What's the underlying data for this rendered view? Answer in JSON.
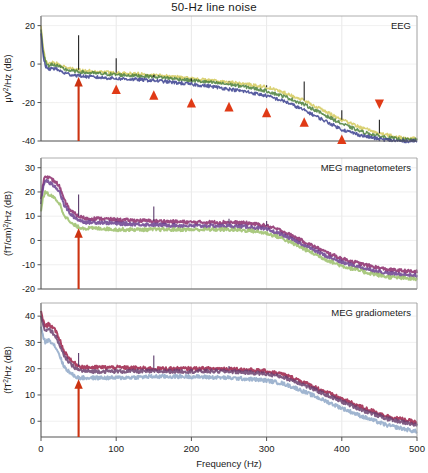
{
  "figure": {
    "title": "50-Hz line noise",
    "xlabel": "Frequency (Hz)",
    "xticks": [
      "0",
      "100",
      "200",
      "300",
      "400",
      "500"
    ],
    "arrow_color": "#cc3311",
    "marker_color": "#e03a16"
  },
  "panels": {
    "eeg": {
      "tag": "EEG",
      "ylabel_main": "/Hz (dB)",
      "ylabel_prefix": "μV",
      "ylabel_sup": "2",
      "yticks": [
        "20",
        "0",
        "-20",
        "-40"
      ]
    },
    "mag": {
      "tag": "MEG magnetometers",
      "ylabel_main": "/Hz (dB)",
      "ylabel_prefix": "(fT/cm)",
      "ylabel_sup": "2",
      "yticks": [
        "30",
        "20",
        "10",
        "0",
        "-10",
        "-20"
      ]
    },
    "grad": {
      "tag": "MEG gradiometers",
      "ylabel_main": "/Hz (dB)",
      "ylabel_prefix": "(fT",
      "ylabel_sup": "2",
      "ylabel_suffix": "",
      "yticks": [
        "40",
        "30",
        "20",
        "10",
        "0"
      ]
    }
  },
  "chart_data": {
    "type": "line",
    "title": "50-Hz line noise",
    "xlabel": "Frequency (Hz)",
    "xlim": [
      0,
      500
    ],
    "xticks": [
      0,
      100,
      200,
      300,
      400,
      500
    ],
    "grid": true,
    "legend": "none",
    "subplots": [
      {
        "name": "EEG",
        "ylabel": "μV2/Hz (dB)",
        "ylim": [
          -40,
          25
        ],
        "yticks": [
          20,
          0,
          -20,
          -40
        ],
        "annotations": [
          {
            "type": "arrow",
            "x": 50,
            "y_from": -40,
            "y_to": -8,
            "color": "#cc3311",
            "label": "50-Hz line noise"
          },
          {
            "type": "triangle-up",
            "x": 100,
            "y": -13
          },
          {
            "type": "triangle-up",
            "x": 150,
            "y": -16
          },
          {
            "type": "triangle-up",
            "x": 200,
            "y": -20
          },
          {
            "type": "triangle-up",
            "x": 250,
            "y": -22
          },
          {
            "type": "triangle-up",
            "x": 300,
            "y": -25
          },
          {
            "type": "triangle-up",
            "x": 350,
            "y": -30
          },
          {
            "type": "triangle-up",
            "x": 400,
            "y": -39
          },
          {
            "type": "triangle-down",
            "x": 450,
            "y": -21
          }
        ],
        "series": [
          {
            "name": "band-upper",
            "color": "#d4c95a",
            "x": [
              0,
              3,
              6,
              10,
              15,
              20,
              25,
              30,
              40,
              50,
              60,
              80,
              100,
              125,
              150,
              175,
              200,
              225,
              250,
              275,
              300,
              325,
              350,
              375,
              400,
              425,
              450,
              475,
              500
            ],
            "values": [
              20,
              8,
              2,
              0,
              1,
              0.5,
              -0.5,
              -1.5,
              -2.5,
              -3,
              -3.5,
              -4,
              -4.5,
              -5,
              -5.5,
              -6.5,
              -7.5,
              -8.5,
              -9.5,
              -10.5,
              -12,
              -15,
              -19,
              -24,
              -29,
              -33,
              -36,
              -38,
              -39
            ]
          },
          {
            "name": "band-mid",
            "color": "#4a7f3a",
            "x": [
              0,
              3,
              6,
              10,
              15,
              20,
              25,
              30,
              40,
              50,
              60,
              80,
              100,
              125,
              150,
              175,
              200,
              225,
              250,
              275,
              300,
              325,
              350,
              375,
              400,
              425,
              450,
              475,
              500
            ],
            "values": [
              18,
              6,
              1,
              -1,
              0,
              -0.5,
              -1.5,
              -2.5,
              -3.5,
              -4,
              -4.5,
              -5,
              -5.5,
              -6,
              -6.5,
              -7.5,
              -8.5,
              -9.5,
              -10.5,
              -12,
              -14,
              -17,
              -21,
              -26,
              -31,
              -35,
              -37.5,
              -39,
              -39.5
            ]
          },
          {
            "name": "band-lower",
            "color": "#3a3f8f",
            "x": [
              0,
              3,
              6,
              10,
              15,
              20,
              25,
              30,
              40,
              50,
              60,
              80,
              100,
              125,
              150,
              175,
              200,
              225,
              250,
              275,
              300,
              325,
              350,
              375,
              400,
              425,
              450,
              475,
              500
            ],
            "values": [
              16,
              4,
              -1,
              -3,
              -2,
              -2.5,
              -3.5,
              -4.5,
              -5.5,
              -6,
              -6.5,
              -7,
              -7.5,
              -8,
              -8.5,
              -9.5,
              -10.5,
              -11.5,
              -13,
              -14.5,
              -16.5,
              -19.5,
              -24,
              -29,
              -34,
              -37,
              -39,
              -40,
              -40
            ]
          }
        ],
        "spikes": [
          {
            "x": 50,
            "peak": 15
          },
          {
            "x": 100,
            "peak": 3
          },
          {
            "x": 150,
            "peak": -7
          },
          {
            "x": 200,
            "peak": -9
          },
          {
            "x": 250,
            "peak": -9
          },
          {
            "x": 300,
            "peak": -11
          },
          {
            "x": 350,
            "peak": -9
          },
          {
            "x": 400,
            "peak": -24
          },
          {
            "x": 450,
            "peak": -29
          }
        ]
      },
      {
        "name": "MEG magnetometers",
        "ylabel": "(fT/cm)2/Hz (dB)",
        "ylim": [
          -20,
          34
        ],
        "yticks": [
          30,
          20,
          10,
          0,
          -10,
          -20
        ],
        "annotations": [
          {
            "type": "arrow",
            "x": 50,
            "y_from": -20,
            "y_to": 4,
            "color": "#cc3311"
          }
        ],
        "series": [
          {
            "name": "band-upper",
            "color": "#8b2a6b",
            "x": [
              0,
              3,
              6,
              10,
              15,
              20,
              25,
              30,
              40,
              50,
              60,
              80,
              100,
              150,
              200,
              250,
              280,
              300,
              320,
              340,
              360,
              380,
              400,
              430,
              460,
              500
            ],
            "values": [
              17,
              24,
              27,
              26,
              25,
              24,
              22,
              17,
              12,
              10,
              9,
              9,
              8.5,
              8,
              7.5,
              7.5,
              7,
              6,
              4,
              1,
              -2,
              -5,
              -7.5,
              -10,
              -12,
              -13
            ]
          },
          {
            "name": "band-mid",
            "color": "#6a3f8f",
            "x": [
              0,
              3,
              6,
              10,
              15,
              20,
              25,
              30,
              40,
              50,
              60,
              80,
              100,
              150,
              200,
              250,
              280,
              300,
              320,
              340,
              360,
              380,
              400,
              430,
              460,
              500
            ],
            "values": [
              15,
              22,
              25,
              24,
              23,
              22,
              20,
              15,
              10.5,
              8.5,
              7.5,
              7.5,
              7,
              6.5,
              6,
              6,
              5.5,
              4.5,
              2.5,
              -0.5,
              -3.5,
              -6.5,
              -9,
              -11.5,
              -13.5,
              -14.5
            ]
          },
          {
            "name": "band-lower",
            "color": "#9bbf6a",
            "x": [
              0,
              3,
              6,
              10,
              15,
              20,
              25,
              30,
              40,
              50,
              60,
              80,
              100,
              150,
              200,
              250,
              280,
              300,
              320,
              340,
              360,
              380,
              400,
              430,
              460,
              500
            ],
            "values": [
              12,
              18,
              20,
              19,
              18,
              17,
              15,
              11,
              7,
              5.5,
              5,
              5,
              4.5,
              4.5,
              4.5,
              4.5,
              4,
              3,
              1,
              -2,
              -5,
              -8,
              -10.5,
              -13,
              -15,
              -16
            ]
          }
        ],
        "spikes": [
          {
            "x": 50,
            "peak": 19
          },
          {
            "x": 100,
            "peak": 9
          },
          {
            "x": 150,
            "peak": 14
          },
          {
            "x": 250,
            "peak": 9
          },
          {
            "x": 300,
            "peak": 8
          }
        ]
      },
      {
        "name": "MEG gradiometers",
        "ylabel": "(fT2/Hz (dB)",
        "ylim": [
          -6,
          45
        ],
        "yticks": [
          40,
          30,
          20,
          10,
          0
        ],
        "annotations": [
          {
            "type": "arrow",
            "x": 50,
            "y_from": -6,
            "y_to": 15,
            "color": "#cc3311"
          }
        ],
        "series": [
          {
            "name": "band-upper",
            "color": "#9c2048",
            "x": [
              0,
              3,
              6,
              10,
              15,
              20,
              25,
              30,
              40,
              50,
              60,
              80,
              100,
              150,
              200,
              250,
              280,
              300,
              320,
              340,
              360,
              380,
              400,
              430,
              460,
              500
            ],
            "values": [
              42,
              38,
              36,
              37,
              36,
              34,
              31,
              27,
              23,
              21,
              20.5,
              20.5,
              20.5,
              20,
              20,
              20,
              19.5,
              19,
              18,
              16,
              13.5,
              11,
              8.5,
              5,
              2,
              -0.5
            ]
          },
          {
            "name": "band-mid",
            "color": "#6a3f6f",
            "x": [
              0,
              3,
              6,
              10,
              15,
              20,
              25,
              30,
              40,
              50,
              60,
              80,
              100,
              150,
              200,
              250,
              280,
              300,
              320,
              340,
              360,
              380,
              400,
              430,
              460,
              500
            ],
            "values": [
              40,
              36,
              34,
              35,
              34,
              32,
              29,
              25,
              21.5,
              19.5,
              19,
              19,
              19,
              19,
              19,
              19,
              18.5,
              18,
              17,
              15,
              12.5,
              10,
              7.5,
              4,
              1,
              -1.5
            ]
          },
          {
            "name": "band-lower",
            "color": "#8fa8c8",
            "x": [
              0,
              3,
              6,
              10,
              15,
              20,
              25,
              30,
              40,
              50,
              60,
              80,
              100,
              150,
              200,
              250,
              280,
              300,
              320,
              340,
              360,
              380,
              400,
              430,
              460,
              500
            ],
            "values": [
              36,
              32,
              30,
              31,
              30,
              28,
              25,
              21,
              18,
              16.5,
              16.5,
              16.5,
              16.5,
              17,
              17,
              16.5,
              16,
              15.5,
              14.5,
              12.5,
              10,
              7.5,
              5,
              1.5,
              -1.5,
              -4
            ]
          }
        ],
        "spikes": [
          {
            "x": 50,
            "peak": 26
          },
          {
            "x": 150,
            "peak": 25
          },
          {
            "x": 250,
            "peak": 21
          }
        ]
      }
    ]
  }
}
